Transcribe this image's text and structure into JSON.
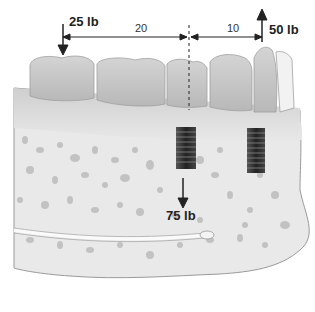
{
  "figure": {
    "forces": {
      "left_force": "25 lb",
      "right_force": "50 lb",
      "implant_force": "75 lb"
    },
    "distances": {
      "left_span": "20",
      "right_span": "10"
    },
    "colors": {
      "bone": "#e6e6e6",
      "bone_pores": "#bdbdbd",
      "teeth": "#c9c9c9",
      "gum": "#d3d3d3",
      "implant": "#3a3a3a",
      "arrows": "#222222"
    }
  }
}
